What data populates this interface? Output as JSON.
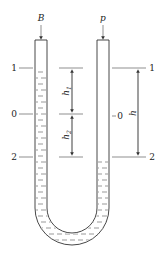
{
  "diagram": {
    "top_labels": {
      "left_tube": "B",
      "right_tube": "p"
    },
    "levels": [
      {
        "id": "level-1",
        "label": "1"
      },
      {
        "id": "level-0",
        "label": "0"
      },
      {
        "id": "level-2",
        "label": "2"
      }
    ],
    "left_level_labels": {
      "l1": "1",
      "l0": "0",
      "l2": "2"
    },
    "right_level_labels": {
      "r1": "1",
      "r0": "0",
      "r2": "2"
    },
    "dimensions": {
      "h1": {
        "symbol": "h",
        "subscript": "1",
        "from": "1",
        "to": "0"
      },
      "h2": {
        "symbol": "h",
        "subscript": "2",
        "from": "0",
        "to": "2"
      },
      "h": {
        "symbol": "h",
        "subscript": "",
        "from": "1",
        "to": "2"
      }
    },
    "liquid": {
      "left_column_top_level": "1",
      "right_column_top_level": "2",
      "fill_pattern": "dashed"
    },
    "colors": {
      "stroke": "#333333",
      "background": "#ffffff"
    }
  }
}
